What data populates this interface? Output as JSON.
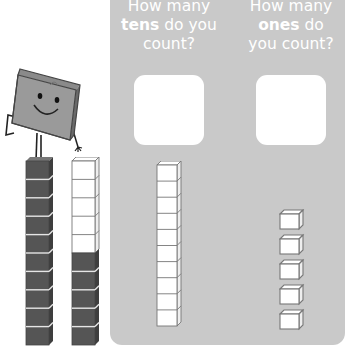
{
  "questions": {
    "tens": {
      "line1": "How many",
      "bold": "tens",
      "line2_rest": " do you",
      "line3": "count?"
    },
    "ones": {
      "line1": "How many",
      "bold": "ones",
      "line2_rest": " do",
      "line3": "you count?"
    }
  },
  "answers": {
    "tens": "",
    "ones": ""
  },
  "manipulatives": {
    "dark_tower_cubes": 10,
    "mixed_tower_white_cubes": 5,
    "mixed_tower_dark_cubes": 5,
    "tens_rods": 1,
    "ones_cubes": 5
  },
  "colors": {
    "panel": "#c9c9c9",
    "dark_cube": "#555555",
    "white_cube": "#ffffff",
    "outline": "#777777"
  }
}
